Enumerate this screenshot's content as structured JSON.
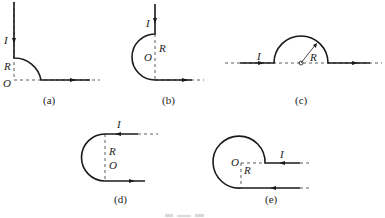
{
  "figure": {
    "colors": {
      "wire": "#1a1a1a",
      "text": "#222222",
      "background": "#ffffff"
    },
    "panels": [
      {
        "id": "a",
        "caption": "(a)",
        "labels": {
          "current": "I",
          "radius": "R",
          "center": "O"
        }
      },
      {
        "id": "b",
        "caption": "(b)",
        "labels": {
          "current": "I",
          "radius": "R",
          "center": "O"
        }
      },
      {
        "id": "c",
        "caption": "(c)",
        "labels": {
          "current": "I",
          "radius": "R"
        }
      },
      {
        "id": "d",
        "caption": "(d)",
        "labels": {
          "current": "I",
          "radius": "R",
          "center": "O"
        }
      },
      {
        "id": "e",
        "caption": "(e)",
        "labels": {
          "current": "I",
          "radius": "R",
          "center": "O"
        }
      }
    ],
    "bottom_caption": ""
  }
}
